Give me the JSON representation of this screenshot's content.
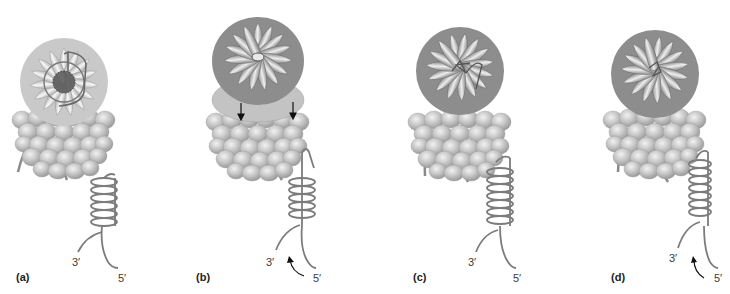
{
  "figure": {
    "colors": {
      "subunit_light": "#d4d4d4",
      "subunit_mid": "#a9a9a9",
      "subunit_dark": "#7c7c7c",
      "strand": "#808080",
      "arrow": "#1a1a1a",
      "text": "#333333"
    },
    "panels": [
      {
        "id": "a",
        "label": "(a)",
        "three_prime": "3′",
        "five_prime": "5′"
      },
      {
        "id": "b",
        "label": "(b)",
        "three_prime": "3′",
        "five_prime": "5′"
      },
      {
        "id": "c",
        "label": "(c)",
        "three_prime": "3′",
        "five_prime": "5′"
      },
      {
        "id": "d",
        "label": "(d)",
        "three_prime": "3′",
        "five_prime": "5′"
      }
    ]
  }
}
